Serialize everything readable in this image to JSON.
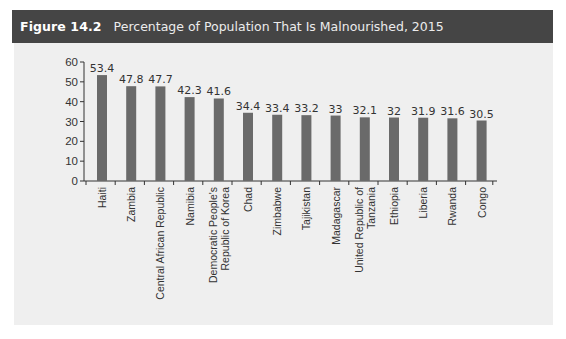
{
  "header": {
    "figure_number": "Figure 14.2",
    "title": "Percentage of Population That Is Malnourished, 2015"
  },
  "colors": {
    "header_bg": "#454545",
    "panel_bg": "#efefef",
    "bar": "#6a6a6a",
    "axis": "#333333"
  },
  "chart_data": {
    "type": "bar",
    "title": "Percentage of Population That Is Malnourished, 2015",
    "xlabel": "",
    "ylabel": "",
    "ylim": [
      0,
      60
    ],
    "yticks": [
      0,
      10,
      20,
      30,
      40,
      50,
      60
    ],
    "grid": false,
    "legend": null,
    "categories": [
      "Haiti",
      "Zambia",
      "Central African Republic",
      "Namibia",
      "Democratic People's Republic of Korea",
      "Chad",
      "Zimbabwe",
      "Tajikistan",
      "Madagascar",
      "United Republic of Tanzania",
      "Ethiopia",
      "Liberia",
      "Rwanda",
      "Congo"
    ],
    "category_lines": [
      [
        "Haiti"
      ],
      [
        "Zambia"
      ],
      [
        "Central African Republic"
      ],
      [
        "Namibia"
      ],
      [
        "Democratic People's",
        "Republic of Korea"
      ],
      [
        "Chad"
      ],
      [
        "Zimbabwe"
      ],
      [
        "Tajikistan"
      ],
      [
        "Madagascar"
      ],
      [
        "United Republic of",
        "Tanzania"
      ],
      [
        "Ethiopia"
      ],
      [
        "Liberia"
      ],
      [
        "Rwanda"
      ],
      [
        "Congo"
      ]
    ],
    "values": [
      53.4,
      47.8,
      47.7,
      42.3,
      41.6,
      34.4,
      33.4,
      33.2,
      33,
      32.1,
      32,
      31.9,
      31.6,
      30.5
    ],
    "value_labels": [
      "53.4",
      "47.8",
      "47.7",
      "42.3",
      "41.6",
      "34.4",
      "33.4",
      "33.2",
      "33",
      "32.1",
      "32",
      "31.9",
      "31.6",
      "30.5"
    ]
  }
}
